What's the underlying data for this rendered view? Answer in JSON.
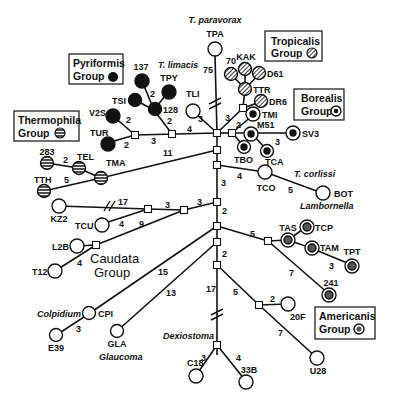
{
  "figure": {
    "type": "unrooted phylogenetic network / distance tree",
    "legend_groups": [
      {
        "id": "pyriformis",
        "line1": "Pyriformis",
        "line2": "Group",
        "symbol": "filled-black"
      },
      {
        "id": "tropicalis",
        "line1": "Tropicalis",
        "line2": "Group",
        "symbol": "hatched"
      },
      {
        "id": "thermophila",
        "line1": "Thermophila",
        "line2": "Group",
        "symbol": "horizontal-striped"
      },
      {
        "id": "borealis",
        "line1": "Borealis",
        "line2": "Group",
        "symbol": "ringed-dot"
      },
      {
        "id": "caudata",
        "line1": "Caudata",
        "line2": "Group",
        "symbol": "none"
      },
      {
        "id": "americanis",
        "line1": "Americanis",
        "line2": "Group",
        "symbol": "ringed-star"
      }
    ],
    "species_labels": {
      "paravorax": "T. paravorax",
      "limacis": "T. limacis",
      "corlissi": "T. corlissi",
      "lambornella": "Lambornella",
      "colpidium": "Colpidium",
      "glaucoma": "Glaucoma",
      "dexiostoma": "Dexiostoma"
    },
    "taxa": [
      {
        "id": "TPA",
        "label": "TPA",
        "type": "open"
      },
      {
        "id": "70",
        "label": "70",
        "type": "hatched"
      },
      {
        "id": "KAK",
        "label": "KAK",
        "type": "hatched"
      },
      {
        "id": "D61",
        "label": "D61",
        "type": "hatched"
      },
      {
        "id": "TTR",
        "label": "TTR",
        "type": "hatched"
      },
      {
        "id": "DR6",
        "label": "DR6",
        "type": "hatched"
      },
      {
        "id": "TMI",
        "label": "TMI",
        "type": "ringed"
      },
      {
        "id": "M51",
        "label": "M51",
        "type": "ringed"
      },
      {
        "id": "SV3",
        "label": "SV3",
        "type": "ringed"
      },
      {
        "id": "TBO",
        "label": "TBO",
        "type": "ringed"
      },
      {
        "id": "TCA",
        "label": "TCA",
        "type": "ringed"
      },
      {
        "id": "137",
        "label": "137",
        "type": "filled"
      },
      {
        "id": "TPY",
        "label": "TPY",
        "type": "filled"
      },
      {
        "id": "TSI",
        "label": "TSI",
        "type": "filled"
      },
      {
        "id": "128",
        "label": "128",
        "type": "filled"
      },
      {
        "id": "V2S",
        "label": "V2S",
        "type": "filled"
      },
      {
        "id": "TUR",
        "label": "TUR",
        "type": "filled"
      },
      {
        "id": "TLI",
        "label": "TLI",
        "type": "open"
      },
      {
        "id": "283",
        "label": "283",
        "type": "striped"
      },
      {
        "id": "TEL",
        "label": "TEL",
        "type": "striped"
      },
      {
        "id": "TMA",
        "label": "TMA",
        "type": "striped"
      },
      {
        "id": "TTH",
        "label": "TTH",
        "type": "striped"
      },
      {
        "id": "TCO",
        "label": "TCO",
        "type": "open"
      },
      {
        "id": "BOT",
        "label": "BOT",
        "type": "open"
      },
      {
        "id": "KZ2",
        "label": "KZ2",
        "type": "open"
      },
      {
        "id": "TCU",
        "label": "TCU",
        "type": "open"
      },
      {
        "id": "L2B",
        "label": "L2B",
        "type": "open"
      },
      {
        "id": "T12",
        "label": "T12",
        "type": "open"
      },
      {
        "id": "TAS",
        "label": "TAS",
        "type": "star"
      },
      {
        "id": "TCP",
        "label": "TCP",
        "type": "star"
      },
      {
        "id": "TAM",
        "label": "TAM",
        "type": "star"
      },
      {
        "id": "TPT",
        "label": "TPT",
        "type": "star"
      },
      {
        "id": "241",
        "label": "241",
        "type": "star"
      },
      {
        "id": "CPI",
        "label": "CPI",
        "type": "open"
      },
      {
        "id": "E39",
        "label": "E39",
        "type": "open"
      },
      {
        "id": "GLA",
        "label": "GLA",
        "type": "open"
      },
      {
        "id": "20F",
        "label": "20F",
        "type": "open"
      },
      {
        "id": "U28",
        "label": "U28",
        "type": "open"
      },
      {
        "id": "C18",
        "label": "C18",
        "type": "open"
      },
      {
        "id": "33B",
        "label": "33B",
        "type": "open"
      }
    ],
    "branch_lengths": {
      "TPA": "75",
      "tropicalis_stem": "3",
      "borealis_stem": "2",
      "M51_SV3": "3",
      "limacis_stem": "4",
      "TLI": "3",
      "pyriformis_stem": "3",
      "128_up": "2",
      "128_TPY": "2",
      "V2S": "2",
      "TUR": "2",
      "thermophila_stem": "11",
      "TEL_283": "2",
      "TTH": "5",
      "trunk_a": "3",
      "TCO": "4",
      "TCO_BOT": "5",
      "trunk_b": "3",
      "KZ2": "17",
      "TCU": "4",
      "caudata_a": "3",
      "caudata_b": "3",
      "caudata_c": "9",
      "T12": "4",
      "trunk_c": "2",
      "americanis_stem": "5",
      "TAM_TPT": "3",
      "241": "7",
      "trunk_d": "2",
      "CPI": "15",
      "E39": "3",
      "GLA": "13",
      "dexiostoma_stem": "17",
      "C18": "3",
      "33B": "4",
      "20F_stem": "5",
      "20F": "2",
      "U28": "7"
    }
  }
}
